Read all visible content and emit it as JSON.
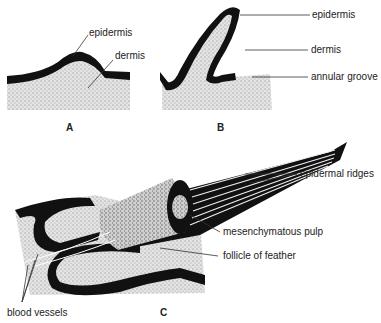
{
  "figure": {
    "panels": {
      "A": {
        "letter": "A",
        "labels": {
          "epidermis": "epidermis",
          "dermis": "dermis"
        }
      },
      "B": {
        "letter": "B",
        "labels": {
          "epidermis": "epidermis",
          "dermis": "dermis",
          "annular_groove": "annular groove"
        }
      },
      "C": {
        "letter": "C",
        "labels": {
          "epidermal_ridges": "epidermal ridges",
          "mesenchymatous_pulp": "mesenchymatous pulp",
          "follicle": "follicle of feather",
          "blood_vessels": "blood vessels"
        }
      }
    },
    "colors": {
      "epidermis": "#111111",
      "dermis": "#d9d9d9",
      "line": "#333333"
    }
  }
}
